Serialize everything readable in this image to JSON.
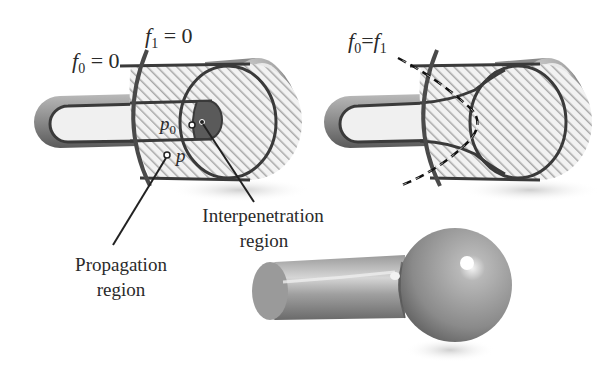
{
  "figure": {
    "left_panel": {
      "labels": {
        "f0": "f",
        "f0_sub": "0",
        "f0_eq": " = 0",
        "f1": "f",
        "f1_sub": "1",
        "f1_eq": " = 0",
        "p0": "p",
        "p0_sub": "0",
        "p": "p"
      }
    },
    "right_panel": {
      "labels": {
        "f0": "f",
        "f0_sub": "0",
        "eq": "=",
        "f1": "f",
        "f1_sub": "1"
      }
    },
    "annotations": {
      "interpenetration_line1": "Interpenetration",
      "interpenetration_line2": "region",
      "propagation_line1": "Propagation",
      "propagation_line2": "region"
    },
    "colors": {
      "outline": "#3a3a3a",
      "hatch": "#9a9a9a",
      "shade_dark": "#6a6a6a",
      "shade_light": "#e8e8e8",
      "interpenetration_fill": "#5a5a5a",
      "text": "#2a2a2a"
    }
  }
}
